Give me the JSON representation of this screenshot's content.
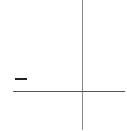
{
  "diagram": {
    "elements": [
      {
        "type": "vertical-axis-line",
        "color": "#8a8a8a"
      },
      {
        "type": "horizontal-axis-line",
        "color": "#555555"
      },
      {
        "type": "minus-sign-mark",
        "color": "#222222"
      }
    ]
  }
}
